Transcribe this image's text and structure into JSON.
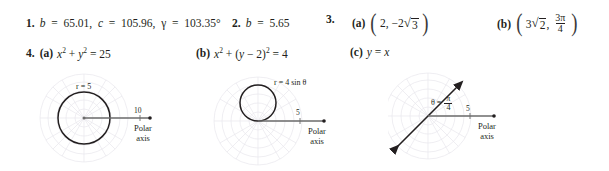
{
  "answers": {
    "items": [
      {
        "number": "1.",
        "b_label": "b",
        "b_value": "65.01",
        "c_label": "c",
        "c_value": "105.96",
        "gamma_label": "γ",
        "gamma_value": "103.35°",
        "comma": ","
      },
      {
        "number": "2.",
        "b_label": "b",
        "b_value": "5.65"
      },
      {
        "number": "3.",
        "parts": [
          {
            "label": "(a)",
            "x": "2",
            "y_coeff": "−2",
            "y_radicand": "3"
          },
          {
            "label": "(b)",
            "x_coeff": "3",
            "x_radicand": "2",
            "theta_numer": "3π",
            "theta_denom": "4"
          }
        ]
      },
      {
        "number": "4.",
        "parts": [
          {
            "label": "(a)",
            "equation_text": "x² + y² = 25"
          },
          {
            "label": "(b)",
            "equation_text": "x² + (y − 2)² = 4"
          },
          {
            "label": "(c)",
            "equation_text": "y = x"
          }
        ]
      }
    ]
  },
  "figures": [
    {
      "id": "figure-4a",
      "equation_label": "r = 5",
      "tick_label": "10",
      "axis_label_line1": "Polar",
      "axis_label_line2": "axis",
      "curve_type": "circle-centered",
      "radius": 5,
      "grid_rings": 5,
      "grid_spokes": 12,
      "grid_color": "#e8e6ec",
      "curve_color": "#231f20",
      "axis_color": "#6b6b6b"
    },
    {
      "id": "figure-4b",
      "equation_label": "r = 4 sin θ",
      "tick_label": "5",
      "axis_label_line1": "Polar",
      "axis_label_line2": "axis",
      "curve_type": "circle-tangent-above",
      "radius": 2,
      "grid_rings": 5,
      "grid_spokes": 12,
      "grid_color": "#e8e6ec",
      "curve_color": "#231f20",
      "axis_color": "#6b6b6b"
    },
    {
      "id": "figure-4c",
      "equation_theta": "θ",
      "equation_equals": "=",
      "equation_numer": "π",
      "equation_denom": "4",
      "tick_label": "5",
      "axis_label_line1": "Polar",
      "axis_label_line2": "axis",
      "curve_type": "line-45-degrees",
      "grid_rings": 5,
      "grid_spokes": 12,
      "grid_color": "#e8e6ec",
      "curve_color": "#231f20",
      "axis_color": "#6b6b6b"
    }
  ]
}
